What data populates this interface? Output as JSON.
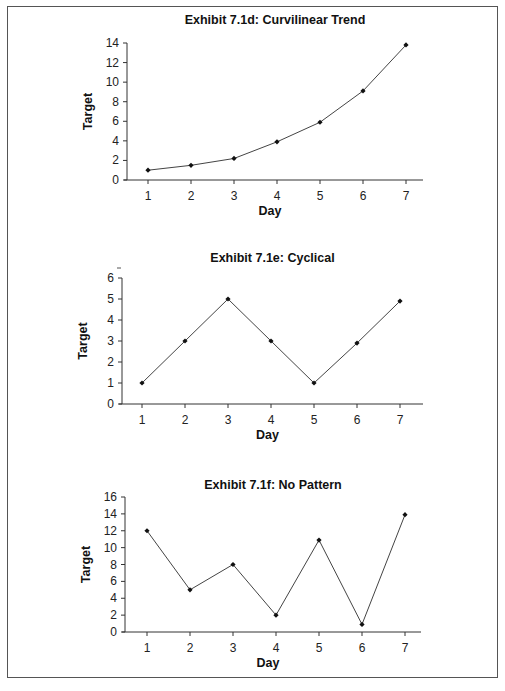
{
  "chart_data": [
    {
      "type": "line",
      "title": "Exhibit 7.1d:  Curvilinear Trend",
      "xlabel": "Day",
      "ylabel": "Target",
      "categories": [
        1,
        2,
        3,
        4,
        5,
        6,
        7
      ],
      "values": [
        1.0,
        1.5,
        2.2,
        3.9,
        5.9,
        9.1,
        13.8
      ],
      "ylim": [
        0,
        14
      ],
      "yticks": [
        0,
        2,
        4,
        6,
        8,
        10,
        12,
        14
      ],
      "grid": false,
      "markers": true
    },
    {
      "type": "line",
      "title": "Exhibit 7.1e:  Cyclical",
      "xlabel": "Day",
      "ylabel": "Target",
      "categories": [
        1,
        2,
        3,
        4,
        5,
        6,
        7
      ],
      "values": [
        1,
        3,
        5,
        3,
        1,
        2.9,
        4.9
      ],
      "ylim": [
        0,
        6
      ],
      "yticks": [
        0,
        1,
        2,
        3,
        4,
        5,
        6
      ],
      "grid": false,
      "markers": true
    },
    {
      "type": "line",
      "title": "Exhibit 7.1f:  No Pattern",
      "xlabel": "Day",
      "ylabel": "Target",
      "categories": [
        1,
        2,
        3,
        4,
        5,
        6,
        7
      ],
      "values": [
        12,
        5,
        8,
        2,
        10.9,
        0.9,
        13.9
      ],
      "ylim": [
        0,
        16
      ],
      "yticks": [
        0,
        2,
        4,
        6,
        8,
        10,
        12,
        14,
        16
      ],
      "grid": false,
      "markers": true
    }
  ],
  "layout": [
    {
      "x0": 127,
      "x1": 423,
      "y0": 180,
      "y1": 43,
      "day1x": 148,
      "dayStep": 43,
      "titleY": 24
    },
    {
      "x0": 122,
      "x1": 423,
      "y0": 404,
      "y1": 278,
      "day1x": 142,
      "dayStep": 43,
      "titleY": 262
    },
    {
      "x0": 125,
      "x1": 421,
      "y0": 632,
      "y1": 497,
      "day1x": 147,
      "dayStep": 43,
      "titleY": 489
    }
  ]
}
